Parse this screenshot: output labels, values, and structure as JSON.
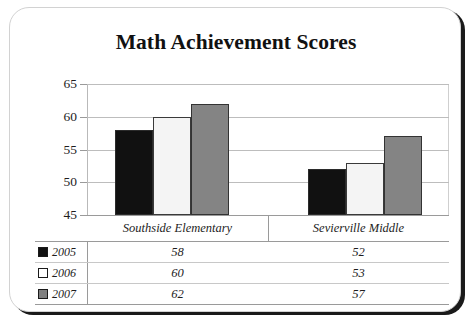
{
  "chart_data": {
    "type": "bar",
    "title": "Math Achievement Scores",
    "xlabel": "",
    "ylabel": "",
    "ylim": [
      45,
      65
    ],
    "yticks": [
      45,
      50,
      55,
      60,
      65
    ],
    "grid": true,
    "legend_position": "table-left-column",
    "categories": [
      "Southside Elementary",
      "Sevierville Middle"
    ],
    "series": [
      {
        "name": "2005",
        "color": "#111111",
        "values": [
          58,
          52
        ]
      },
      {
        "name": "2006",
        "color": "#ffffff",
        "values": [
          60,
          53
        ]
      },
      {
        "name": "2007",
        "color": "#808080",
        "values": [
          62,
          57
        ]
      }
    ],
    "data_table": {
      "column_headers": [
        "Southside Elementary",
        "Sevierville Middle"
      ],
      "rows": [
        {
          "label": "2005",
          "swatch": "black-swatch-icon",
          "values": [
            "58",
            "52"
          ]
        },
        {
          "label": "2006",
          "swatch": "white-swatch-icon",
          "values": [
            "60",
            "53"
          ]
        },
        {
          "label": "2007",
          "swatch": "gray-swatch-icon",
          "values": [
            "62",
            "57"
          ]
        }
      ]
    }
  },
  "axis": {
    "tick_labels": [
      "65",
      "60",
      "55",
      "50",
      "45"
    ]
  }
}
